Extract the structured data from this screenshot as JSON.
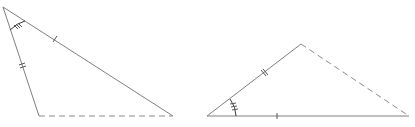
{
  "diagram": {
    "colors": {
      "line": "#7f7f7f",
      "dashed": "#8a8a8a",
      "marks": "#3a3a3a",
      "background": "#ffffff"
    },
    "triangles": [
      {
        "id": "left-triangle",
        "vertices": {
          "A": [
            3,
            7
          ],
          "B": [
            39,
            116
          ],
          "C": [
            173,
            116
          ]
        },
        "sides": [
          {
            "from": "A",
            "to": "C",
            "style": "solid",
            "tick_marks": 1
          },
          {
            "from": "A",
            "to": "B",
            "style": "solid",
            "tick_marks": 2
          },
          {
            "from": "B",
            "to": "C",
            "style": "dashed",
            "tick_marks": 0
          }
        ],
        "angle_mark": {
          "vertex": "A",
          "arc_radius": 22,
          "tick_marks": 3
        }
      },
      {
        "id": "right-triangle",
        "vertices": {
          "D": [
            207,
            116
          ],
          "E": [
            301,
            44
          ],
          "F": [
            409,
            116
          ]
        },
        "sides": [
          {
            "from": "D",
            "to": "E",
            "style": "solid",
            "tick_marks": 2
          },
          {
            "from": "D",
            "to": "F",
            "style": "solid",
            "tick_marks": 1
          },
          {
            "from": "E",
            "to": "F",
            "style": "dashed",
            "tick_marks": 0
          }
        ],
        "angle_mark": {
          "vertex": "D",
          "arc_radius": 30,
          "tick_marks": 3
        }
      }
    ]
  }
}
